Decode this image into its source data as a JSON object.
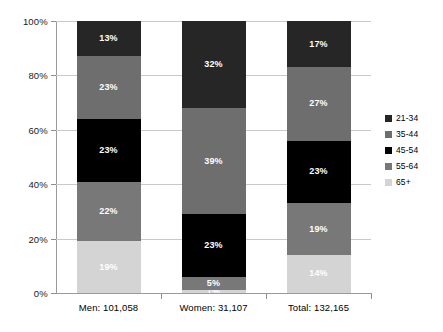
{
  "chart_data": {
    "type": "bar",
    "subtype": "100% stacked column",
    "title": "",
    "xlabel": "",
    "ylabel": "",
    "ylim": [
      0,
      100
    ],
    "ytick_labels": [
      "0%",
      "20%",
      "40%",
      "60%",
      "80%",
      "100%"
    ],
    "ytick_values": [
      0,
      20,
      40,
      60,
      80,
      100
    ],
    "grid": true,
    "legend_position": "right",
    "categories": [
      "Men: 101,058",
      "Women: 31,107",
      "Total: 132,165"
    ],
    "series": [
      {
        "name": "21-34",
        "color": "#262626",
        "text_color": "#ffffff",
        "values": [
          13,
          32,
          17
        ],
        "labels": [
          "13%",
          "32%",
          "17%"
        ]
      },
      {
        "name": "35-44",
        "color": "#6e6e6e",
        "text_color": "#ffffff",
        "values": [
          23,
          39,
          27
        ],
        "labels": [
          "23%",
          "39%",
          "27%"
        ]
      },
      {
        "name": "45-54",
        "color": "#000000",
        "text_color": "#ffffff",
        "values": [
          23,
          23,
          23
        ],
        "labels": [
          "23%",
          "23%",
          "23%"
        ]
      },
      {
        "name": "55-64",
        "color": "#787878",
        "text_color": "#ffffff",
        "values": [
          22,
          5,
          19
        ],
        "labels": [
          "22%",
          "5%",
          "19%"
        ]
      },
      {
        "name": "65+",
        "color": "#d4d4d4",
        "text_color": "#ffffff",
        "values": [
          19,
          1,
          14
        ],
        "labels": [
          "19%",
          "1%",
          "14%"
        ]
      }
    ]
  },
  "axis": {
    "line_color": "#9a9a9a",
    "grid_color": "#c9c9c9"
  }
}
